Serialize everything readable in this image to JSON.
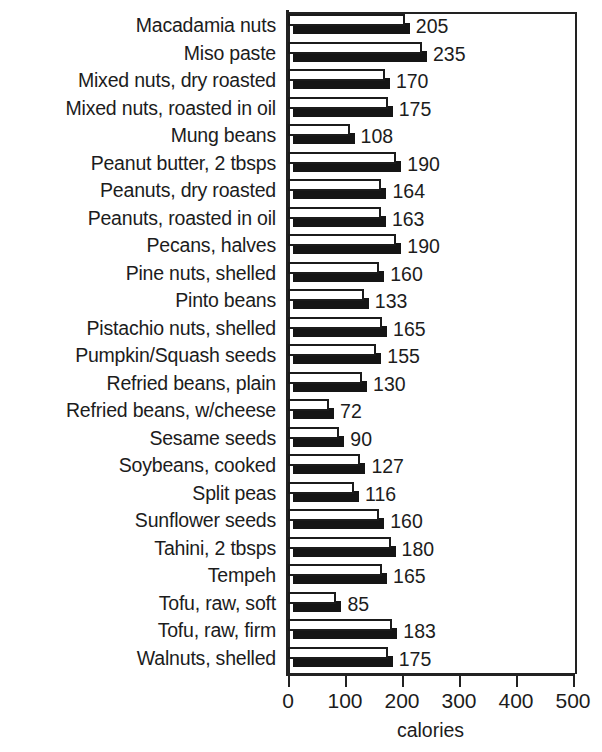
{
  "chart_data": {
    "type": "bar",
    "orientation": "horizontal",
    "title": "",
    "xlabel": "calories",
    "ylabel": "",
    "xlim": [
      0,
      500
    ],
    "xticks": [
      0,
      100,
      200,
      300,
      400,
      500
    ],
    "grid": false,
    "legend": null,
    "style": "3d-horizontal-bar",
    "categories": [
      "Macadamia nuts",
      "Miso paste",
      "Mixed nuts, dry roasted",
      "Mixed nuts, roasted in oil",
      "Mung beans",
      "Peanut butter, 2 tbsps",
      "Peanuts, dry roasted",
      "Peanuts, roasted in oil",
      "Pecans, halves",
      "Pine nuts, shelled",
      "Pinto beans",
      "Pistachio nuts, shelled",
      "Pumpkin/Squash seeds",
      "Refried beans, plain",
      "Refried beans, w/cheese",
      "Sesame seeds",
      "Soybeans, cooked",
      "Split peas",
      "Sunflower seeds",
      "Tahini, 2 tbsps",
      "Tempeh",
      "Tofu, raw, soft",
      "Tofu, raw, firm",
      "Walnuts, shelled"
    ],
    "values": [
      205,
      235,
      170,
      175,
      108,
      190,
      164,
      163,
      190,
      160,
      133,
      165,
      155,
      130,
      72,
      90,
      127,
      116,
      160,
      180,
      165,
      85,
      183,
      175
    ],
    "value_labels": [
      "205",
      "235",
      "170",
      "175",
      "108",
      "190",
      "164",
      "163",
      "190",
      "160",
      "133",
      "165",
      "155",
      "130",
      "72",
      "90",
      "127",
      "116",
      "160",
      "180",
      "165",
      "85",
      "183",
      "175"
    ],
    "xtick_labels": [
      "0",
      "100",
      "200",
      "300",
      "400",
      "500"
    ],
    "colors": {
      "bar_face": "#ffffff",
      "bar_outline": "#1b1b1b",
      "bar_shadow": "#151515",
      "axis": "#222222",
      "text": "#1c1c1c",
      "background": "#ffffff"
    }
  },
  "axis": {
    "x_title": "calories"
  }
}
